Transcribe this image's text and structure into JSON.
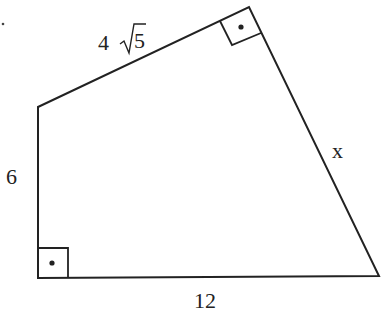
{
  "diagram": {
    "type": "quadrilateral",
    "stray_mark": ".",
    "labels": {
      "top_side": "4",
      "top_side_radicand": "5",
      "left_side": "6",
      "bottom_side": "12",
      "right_side": "x"
    },
    "right_angles": [
      "bottom-left",
      "top"
    ],
    "line_color": "#222222"
  }
}
